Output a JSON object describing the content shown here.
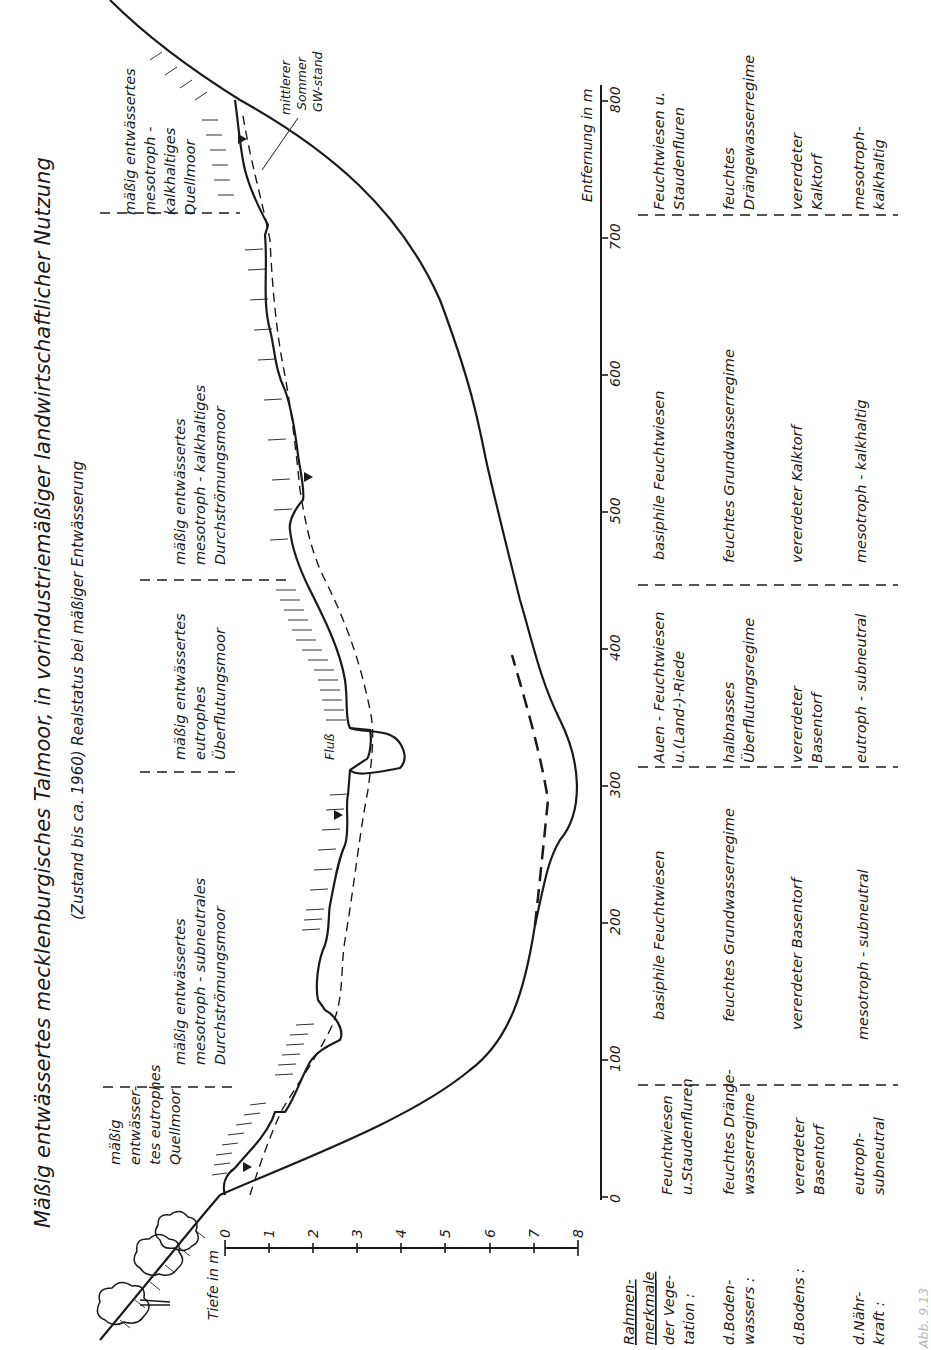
{
  "figure": {
    "title": "Mäßig entwässertes mecklenburgisches Talmoor, in vorindustriemäßiger landwirtschaftlicher Nutzung",
    "subtitle": "(Zustand bis ca. 1960) Realstatus bei mäßiger Entwässerung",
    "caption_partial": "Abb. 9.13",
    "orientation": "rotated 90° counter-clockwise"
  },
  "axes": {
    "depth": {
      "label": "Tiefe in m",
      "ticks": [
        "0",
        "1",
        "2",
        "3",
        "4",
        "5",
        "6",
        "7",
        "8"
      ]
    },
    "distance": {
      "label": "Entfernung in m",
      "ticks": [
        "0",
        "100",
        "200",
        "300",
        "400",
        "500",
        "600",
        "700",
        "800"
      ]
    }
  },
  "annotations": {
    "river": "Fluß",
    "groundwater_l1": "mittlerer",
    "groundwater_l2": "Sommer",
    "groundwater_l3": "GW-stand"
  },
  "zones": [
    {
      "lines": [
        "mäßig",
        "entwässer-",
        "tes eutrophes",
        "Quellmoor"
      ],
      "range_m": [
        0,
        80
      ]
    },
    {
      "lines": [
        "mäßig entwässertes",
        "mesotroph - subneutrales",
        "Durchströmungsmoor"
      ],
      "range_m": [
        80,
        315
      ]
    },
    {
      "lines": [
        "mäßig entwässertes",
        "eutrophes",
        "Überflutungsmoor"
      ],
      "range_m": [
        315,
        450
      ]
    },
    {
      "lines": [
        "mäßig entwässertes",
        "mesotroph - kalkhaltiges",
        "Durchströmungsmoor"
      ],
      "range_m": [
        450,
        720
      ]
    },
    {
      "lines": [
        "mäßig entwässertes",
        "mesotroph -",
        "kalkhaltiges",
        "Quellmoor"
      ],
      "range_m": [
        720,
        800
      ]
    }
  ],
  "table": {
    "header": {
      "title_l1": "Rahmen-",
      "title_l2": "merkmale",
      "rows": [
        [
          "der Vege-",
          "tation :"
        ],
        [
          "d.Boden-",
          "wassers :"
        ],
        [
          "d.Bodens :"
        ],
        [
          "d.Nähr-",
          "kraft :"
        ]
      ]
    },
    "columns": [
      {
        "vegetation": [
          "Feuchtwiesen",
          "u.Staudenfluren"
        ],
        "water": [
          "feuchtes Dränge-",
          "wasserregime"
        ],
        "soil": [
          "vererdeter",
          "Basentorf"
        ],
        "nutrients": [
          "eutroph-",
          "subneutral"
        ]
      },
      {
        "vegetation": [
          "basiphile Feuchtwiesen"
        ],
        "water": [
          "feuchtes Grundwasserregime"
        ],
        "soil": [
          "vererdeter Basentorf"
        ],
        "nutrients": [
          "mesotroph - subneutral"
        ]
      },
      {
        "vegetation": [
          "Auen - Feuchtwiesen",
          "u.(Land-)-Riede"
        ],
        "water": [
          "halbnasses",
          "Überflutungsregime"
        ],
        "soil": [
          "vererdeter",
          "Basentorf"
        ],
        "nutrients": [
          "eutroph - subneutral"
        ]
      },
      {
        "vegetation": [
          "basiphile Feuchtwiesen"
        ],
        "water": [
          "feuchtes Grundwasserregime"
        ],
        "soil": [
          "vererdeter Kalktorf"
        ],
        "nutrients": [
          "mesotroph - kalkhaltig"
        ]
      },
      {
        "vegetation": [
          "Feuchtwiesen u.",
          "Staudenfluren"
        ],
        "water": [
          "feuchtes",
          "Drängewasserregime"
        ],
        "soil": [
          "vererdeter",
          "Kalktorf"
        ],
        "nutrients": [
          "mesotroph-",
          "kalkhaltig"
        ]
      }
    ]
  },
  "colors": {
    "ink": "#1a1a1a",
    "paper": "#ffffff"
  }
}
